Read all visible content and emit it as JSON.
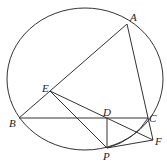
{
  "diagram": {
    "title": "",
    "points": {
      "A": {
        "label": "A",
        "x": 127,
        "y": 24
      },
      "B": {
        "label": "B",
        "x": 19,
        "y": 118
      },
      "C": {
        "label": "C",
        "x": 148,
        "y": 118
      },
      "D": {
        "label": "D",
        "x": 107,
        "y": 118
      },
      "E": {
        "label": "E",
        "x": 50,
        "y": 91
      },
      "F": {
        "label": "F",
        "x": 153,
        "y": 140
      },
      "P": {
        "label": "P",
        "x": 107,
        "y": 148
      }
    },
    "circle": {
      "cx": 85,
      "cy": 79,
      "rx": 78,
      "ry": 71
    },
    "segments": [
      "AB",
      "AF",
      "BC",
      "EF",
      "EP",
      "DP",
      "PF",
      "PC"
    ]
  }
}
